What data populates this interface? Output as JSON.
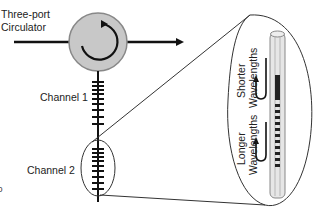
{
  "diagram": {
    "circulator_label_line1": "Three-port",
    "circulator_label_line2": "Circulator",
    "channel1_label": "Channel 1",
    "channel2_label": "Channel 2",
    "shorter_line1": "Shorter",
    "shorter_line2": "Wavelengths",
    "longer_line1": "Longer",
    "longer_line2": "Wavelengths",
    "stray_mark": "0"
  },
  "colors": {
    "line": "#111111",
    "circulator_fill": "#c8c8c8",
    "fiber_fill": "#e6e6e6"
  }
}
